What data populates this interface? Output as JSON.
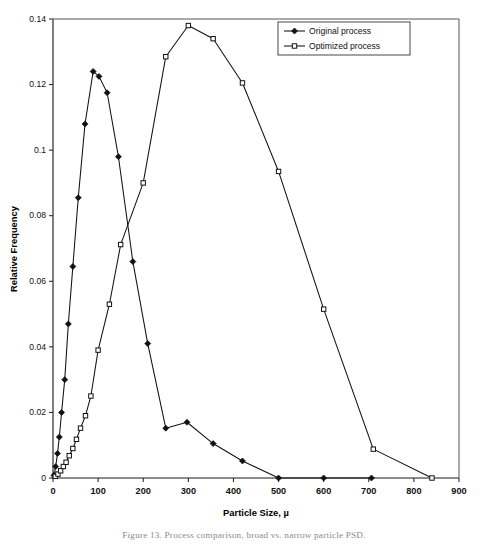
{
  "figure": {
    "caption": "Figure 13.  Process comparison, broad vs. narrow particle PSD."
  },
  "chart_data": {
    "type": "line",
    "title": "",
    "xlabel": "Particle Size, µ",
    "ylabel": "Relative Frequency",
    "xlim": [
      0,
      900
    ],
    "ylim": [
      0,
      0.14
    ],
    "xticks": [
      0,
      100,
      200,
      300,
      400,
      500,
      600,
      700,
      800,
      900
    ],
    "xtick_labels": [
      "0",
      "100",
      "200",
      "300",
      "400",
      "500",
      "600",
      "700",
      "800",
      "900"
    ],
    "yticks": [
      0,
      0.02,
      0.04,
      0.06,
      0.08,
      0.1,
      0.12,
      0.14
    ],
    "ytick_labels": [
      "0",
      "0.02",
      "0.04",
      "0.06",
      "0.08",
      "0.1",
      "0.12",
      "0.14"
    ],
    "grid": false,
    "legend_position": "top-right",
    "series": [
      {
        "name": "Original process",
        "marker": "filled-diamond",
        "color": "#111111",
        "points": [
          {
            "x": 2,
            "y": 0.0008
          },
          {
            "x": 6,
            "y": 0.0035
          },
          {
            "x": 10,
            "y": 0.0075
          },
          {
            "x": 14,
            "y": 0.0125
          },
          {
            "x": 19,
            "y": 0.02
          },
          {
            "x": 26,
            "y": 0.03
          },
          {
            "x": 34,
            "y": 0.047
          },
          {
            "x": 44,
            "y": 0.0645
          },
          {
            "x": 56,
            "y": 0.0855
          },
          {
            "x": 71,
            "y": 0.108
          },
          {
            "x": 89,
            "y": 0.124
          },
          {
            "x": 102,
            "y": 0.1225
          },
          {
            "x": 120,
            "y": 0.1175
          },
          {
            "x": 145,
            "y": 0.098
          },
          {
            "x": 177,
            "y": 0.066
          },
          {
            "x": 210,
            "y": 0.041
          },
          {
            "x": 250,
            "y": 0.0152
          },
          {
            "x": 297,
            "y": 0.017
          },
          {
            "x": 355,
            "y": 0.0105
          },
          {
            "x": 420,
            "y": 0.0052
          },
          {
            "x": 500,
            "y": 0.0
          },
          {
            "x": 600,
            "y": 0.0
          },
          {
            "x": 706,
            "y": 0.0
          }
        ]
      },
      {
        "name": "Optimized process",
        "marker": "open-square",
        "color": "#111111",
        "points": [
          {
            "x": 5,
            "y": 0.0005
          },
          {
            "x": 11,
            "y": 0.0012
          },
          {
            "x": 17,
            "y": 0.0022
          },
          {
            "x": 23,
            "y": 0.0035
          },
          {
            "x": 29,
            "y": 0.0048
          },
          {
            "x": 36,
            "y": 0.0068
          },
          {
            "x": 44,
            "y": 0.009
          },
          {
            "x": 52,
            "y": 0.0118
          },
          {
            "x": 61,
            "y": 0.0152
          },
          {
            "x": 72,
            "y": 0.019
          },
          {
            "x": 84,
            "y": 0.025
          },
          {
            "x": 100,
            "y": 0.039
          },
          {
            "x": 125,
            "y": 0.053
          },
          {
            "x": 150,
            "y": 0.0712
          },
          {
            "x": 200,
            "y": 0.09
          },
          {
            "x": 250,
            "y": 0.1285
          },
          {
            "x": 300,
            "y": 0.138
          },
          {
            "x": 355,
            "y": 0.134
          },
          {
            "x": 420,
            "y": 0.1205
          },
          {
            "x": 500,
            "y": 0.0935
          },
          {
            "x": 600,
            "y": 0.0515
          },
          {
            "x": 710,
            "y": 0.0088
          },
          {
            "x": 840,
            "y": 0.0
          }
        ]
      }
    ]
  }
}
